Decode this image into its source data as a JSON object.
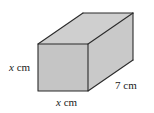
{
  "figure": {
    "shape": "cuboid",
    "background_color": "#ffffff",
    "edge_color": "#2b2b2b",
    "face_colors": {
      "front": "#c5c5c5",
      "top": "#cfcfcf",
      "right": "#c9c9c9"
    },
    "geometry": {
      "front_face": {
        "left": 38,
        "top": 44,
        "right": 88,
        "bottom": 91
      },
      "depth_offset": {
        "dx": 45,
        "dy": -31
      },
      "vertices": {
        "front_top_left": "38,44",
        "front_top_right": "88,44",
        "front_bottom_right": "88,91",
        "front_bottom_left": "38,91",
        "back_top_left": "83,13",
        "back_top_right": "133,13",
        "back_bottom_right": "133,60"
      }
    }
  },
  "labels": {
    "height": {
      "variable": "x",
      "unit": "cm",
      "full": "x cm",
      "position": "left"
    },
    "width": {
      "variable": "x",
      "unit": "cm",
      "full": "x cm",
      "position": "bottom"
    },
    "depth": {
      "value": "7",
      "unit": "cm",
      "full": "7 cm",
      "position": "right"
    }
  }
}
